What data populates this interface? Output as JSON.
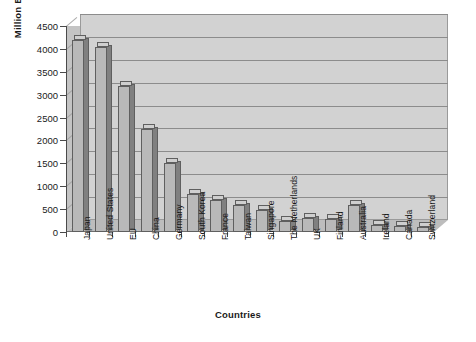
{
  "chart_data": {
    "type": "bar",
    "title": "",
    "xlabel": "Countries",
    "ylabel": "Million Euros",
    "categories": [
      "Japan",
      "United States",
      "EU",
      "China",
      "Germany",
      "South Korea",
      "France",
      "Taiwan",
      "Singapore",
      "The Netherlands",
      "UK",
      "Finland",
      "Australia",
      "Ireland",
      "Canada",
      "Switzerland"
    ],
    "values": [
      4200,
      4050,
      3200,
      2250,
      1500,
      820,
      700,
      600,
      490,
      250,
      310,
      290,
      600,
      150,
      130,
      110
    ],
    "ylim": [
      0,
      4500
    ],
    "ytick_values": [
      0,
      500,
      1000,
      1500,
      2000,
      2500,
      3000,
      3500,
      4000,
      4500
    ],
    "ytick_labels": [
      "0",
      "500",
      "1000",
      "1500",
      "2000",
      "2500",
      "3000",
      "3500",
      "4000",
      "4500"
    ],
    "grid": true,
    "legend": "none",
    "style": "3d-column",
    "colors": {
      "bar_face": "#b9b9b9",
      "bar_side": "#808080",
      "bar_top": "#cfcfcf",
      "bar_edge": "#5f5f5f",
      "plot_back_wall": "#d2d2d2",
      "plot_side_wall": "#c4c4c4",
      "plot_floor": "#bdbdbd",
      "gridline": "#8c8c8c",
      "axis": "#4a4a4a",
      "text": "#1a1a1a",
      "background": "#ffffff"
    }
  }
}
